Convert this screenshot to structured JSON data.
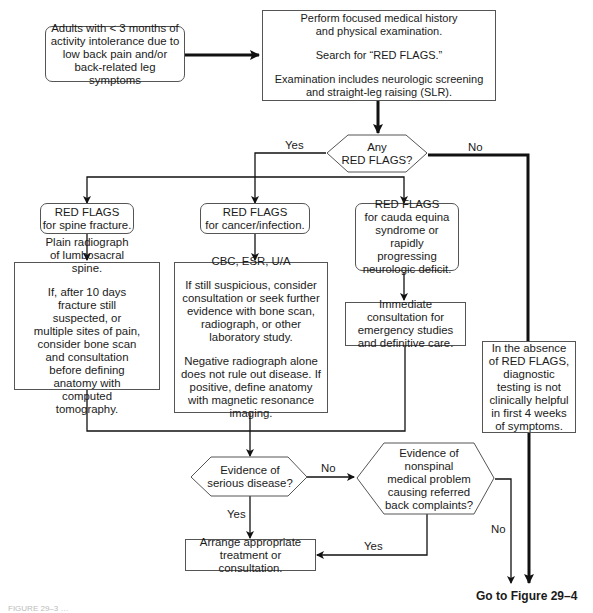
{
  "diagram": {
    "start": {
      "text": "Adults with < 3 months of activity intolerance due to low back pain and/or back-related leg symptoms"
    },
    "assessment": {
      "line1": "Perform focused medical history and physical examination.",
      "line2": "Search for “RED FLAGS.”",
      "line3": "Examination includes neurologic screening and straight-leg raising (SLR)."
    },
    "decision_red_flags": {
      "line1": "Any",
      "line2": "RED FLAGS?",
      "yes_label": "Yes",
      "no_label": "No"
    },
    "branches": [
      {
        "flag": {
          "line1": "RED FLAGS",
          "line2": "for spine fracture."
        },
        "action": {
          "p1": "Plain radiograph of lumbosacral spine.",
          "p2": "If, after 10 days fracture still suspected, or multiple sites of pain, consider bone scan and consultation before defining anatomy with computed tomography."
        }
      },
      {
        "flag": {
          "line1": "RED FLAGS",
          "line2": "for cancer/infection."
        },
        "action": {
          "p1": "CBC, ESR, U/A",
          "p2": "If still suspicious, consider consultation or seek further evidence with bone scan, radiograph, or other laboratory study.",
          "p3": "Negative radiograph alone does not rule out disease. If positive, define anatomy with magnetic resonance imaging."
        }
      },
      {
        "flag": {
          "line1": "RED FLAGS",
          "line2": "for cauda equina syndrome or rapidly progressing neurologic deficit."
        },
        "action": {
          "p1": "Immediate consultation for emergency studies and definitive care."
        }
      }
    ],
    "no_flags_note": {
      "text": "In the absence of RED FLAGS, diagnostic testing is not clinically helpful in first 4 weeks of symptoms."
    },
    "decision_serious": {
      "line1": "Evidence of",
      "line2": "serious disease?",
      "yes_label": "Yes",
      "no_label": "No"
    },
    "decision_nonspinal": {
      "text": "Evidence of nonspinal medical problem causing referred back complaints?",
      "yes_label": "Yes",
      "no_label": "No"
    },
    "treatment": {
      "text": "Arrange appropriate treatment or consultation."
    },
    "goto": {
      "text": "Go to Figure 29–4"
    },
    "caption": {
      "text": "FIGURE 29–3  …"
    }
  }
}
